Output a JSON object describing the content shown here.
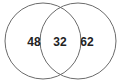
{
  "diagram": {
    "type": "venn",
    "sets": [
      {
        "name": "left-set",
        "only_value": "48"
      },
      {
        "name": "right-set",
        "only_value": "62"
      }
    ],
    "intersection_value": "32",
    "stroke_color": "#6b6b6b",
    "background": "#ffffff"
  }
}
